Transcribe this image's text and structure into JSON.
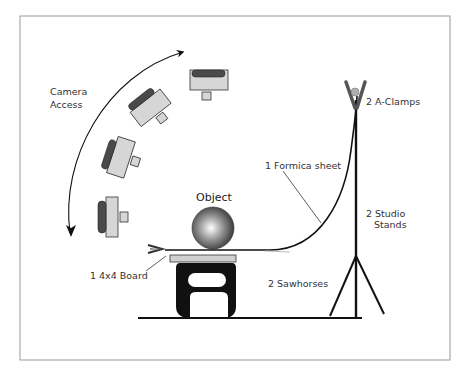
{
  "diagram": {
    "labels": {
      "camera_access_line1": "Camera",
      "camera_access_line2": "Access",
      "object": "Object",
      "a_clamps": "2 A-Clamps",
      "formica": "1 Formica sheet",
      "studio_stands_line1": "2 Studio",
      "studio_stands_line2": "Stands",
      "board": "1 4x4 Board",
      "sawhorses": "2 Sawhorses"
    },
    "cameras": [
      {
        "position": "top",
        "rotation_deg": 0
      },
      {
        "position": "upper-diagonal",
        "rotation_deg": -35
      },
      {
        "position": "middle",
        "rotation_deg": -70
      },
      {
        "position": "side",
        "rotation_deg": -90
      }
    ],
    "colors": {
      "frame": "#999999",
      "line": "#111111",
      "camera_body": "#d6d6d6",
      "camera_grip": "#4a4a4a",
      "clamp": "#555555",
      "clamp_pivot": "#b0b0b0",
      "board": "#d0d0d0"
    }
  }
}
